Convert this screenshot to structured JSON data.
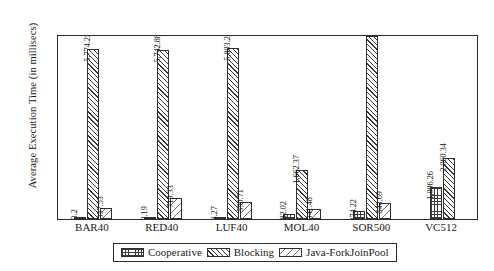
{
  "chart_data": {
    "type": "bar",
    "title": "",
    "xlabel": "",
    "ylabel": "Average Execution Time (in millisecs)",
    "categories": [
      "BAR40",
      "RED40",
      "LUF40",
      "MOL40",
      "SOR500",
      "VC512"
    ],
    "ylim": [
      0,
      6200
    ],
    "grid": false,
    "legend_position": "bottom",
    "series": [
      {
        "name": "Cooperative",
        "pattern": "grid-hatch",
        "values": [
          53.2,
          72.19,
          78.27,
          182.02,
          274.22,
          1096.26
        ],
        "labels": [
          "53.2",
          "72.19",
          "78.27",
          "182.02",
          "274.22",
          "1,096.26"
        ]
      },
      {
        "name": "Blocking",
        "pattern": "diagonal-hatch",
        "values": [
          5774.25,
          5742.88,
          5803.28,
          1662.37,
          6200.0,
          2060.34
        ],
        "labels": [
          "5,774.25",
          "5,742.88",
          "5,803.28",
          "1,662.37",
          "",
          "2,060.34"
        ]
      },
      {
        "name": "Java-ForkJoinPool",
        "pattern": "sparse-diagonal-hatch",
        "values": [
          357.53,
          719.33,
          590.71,
          341.48,
          543.69,
          0
        ],
        "labels": [
          "357.53",
          "719.33",
          "590.71",
          "341.48",
          "543.69",
          ""
        ]
      }
    ]
  },
  "legend": {
    "items": [
      {
        "label": "Cooperative"
      },
      {
        "label": "Blocking"
      },
      {
        "label": "Java-ForkJoinPool"
      }
    ]
  }
}
